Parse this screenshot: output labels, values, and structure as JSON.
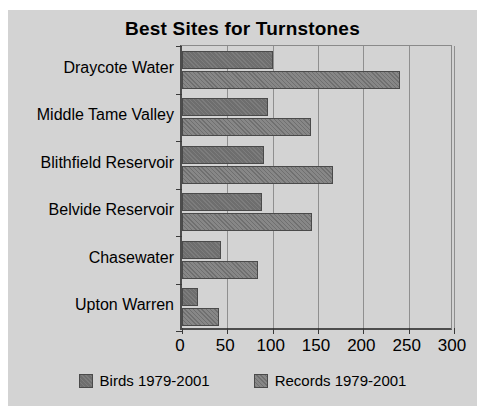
{
  "chart_data": {
    "type": "bar",
    "orientation": "horizontal",
    "title": "Best Sites for Turnstones",
    "xlabel": "",
    "ylabel": "",
    "xlim": [
      0,
      300
    ],
    "xticks": [
      0,
      50,
      100,
      150,
      200,
      250,
      300
    ],
    "grid": true,
    "legend_position": "bottom",
    "categories": [
      "Draycote Water",
      "Middle Tame Valley",
      "Blithfield Reservoir",
      "Belvide Reservoir",
      "Chasewater",
      "Upton Warren"
    ],
    "series": [
      {
        "name": "Birds 1979-2001",
        "color": "#6e6e6e",
        "values": [
          100,
          95,
          90,
          88,
          43,
          18
        ]
      },
      {
        "name": "Records 1979-2001",
        "color": "#808080",
        "values": [
          240,
          142,
          167,
          143,
          84,
          41
        ]
      }
    ]
  },
  "chart": {
    "title": "Best Sites for Turnstones",
    "tick_labels": [
      "0",
      "50",
      "100",
      "150",
      "200",
      "250",
      "300"
    ],
    "category_labels": [
      "Draycote Water",
      "Middle Tame Valley",
      "Blithfield Reservoir",
      "Belvide Reservoir",
      "Chasewater",
      "Upton Warren"
    ],
    "legend": [
      {
        "label": "Birds 1979-2001",
        "swatch": "birds-swatch"
      },
      {
        "label": "Records 1979-2001",
        "swatch": "records-swatch"
      }
    ]
  }
}
